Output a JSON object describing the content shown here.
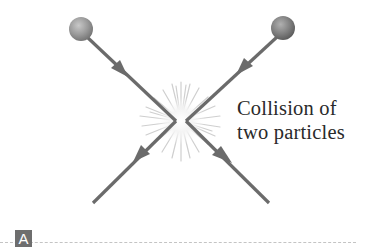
{
  "figure": {
    "caption_line1": "Collision of",
    "caption_line2": "two particles",
    "panel_label": "A"
  },
  "colors": {
    "particle_line": "#6b6b6b",
    "particle_ball": "#8a8a8a",
    "burst": "#d9d9d9",
    "text": "#2a2a2a",
    "panel_label_bg": "#6e6e6e"
  }
}
